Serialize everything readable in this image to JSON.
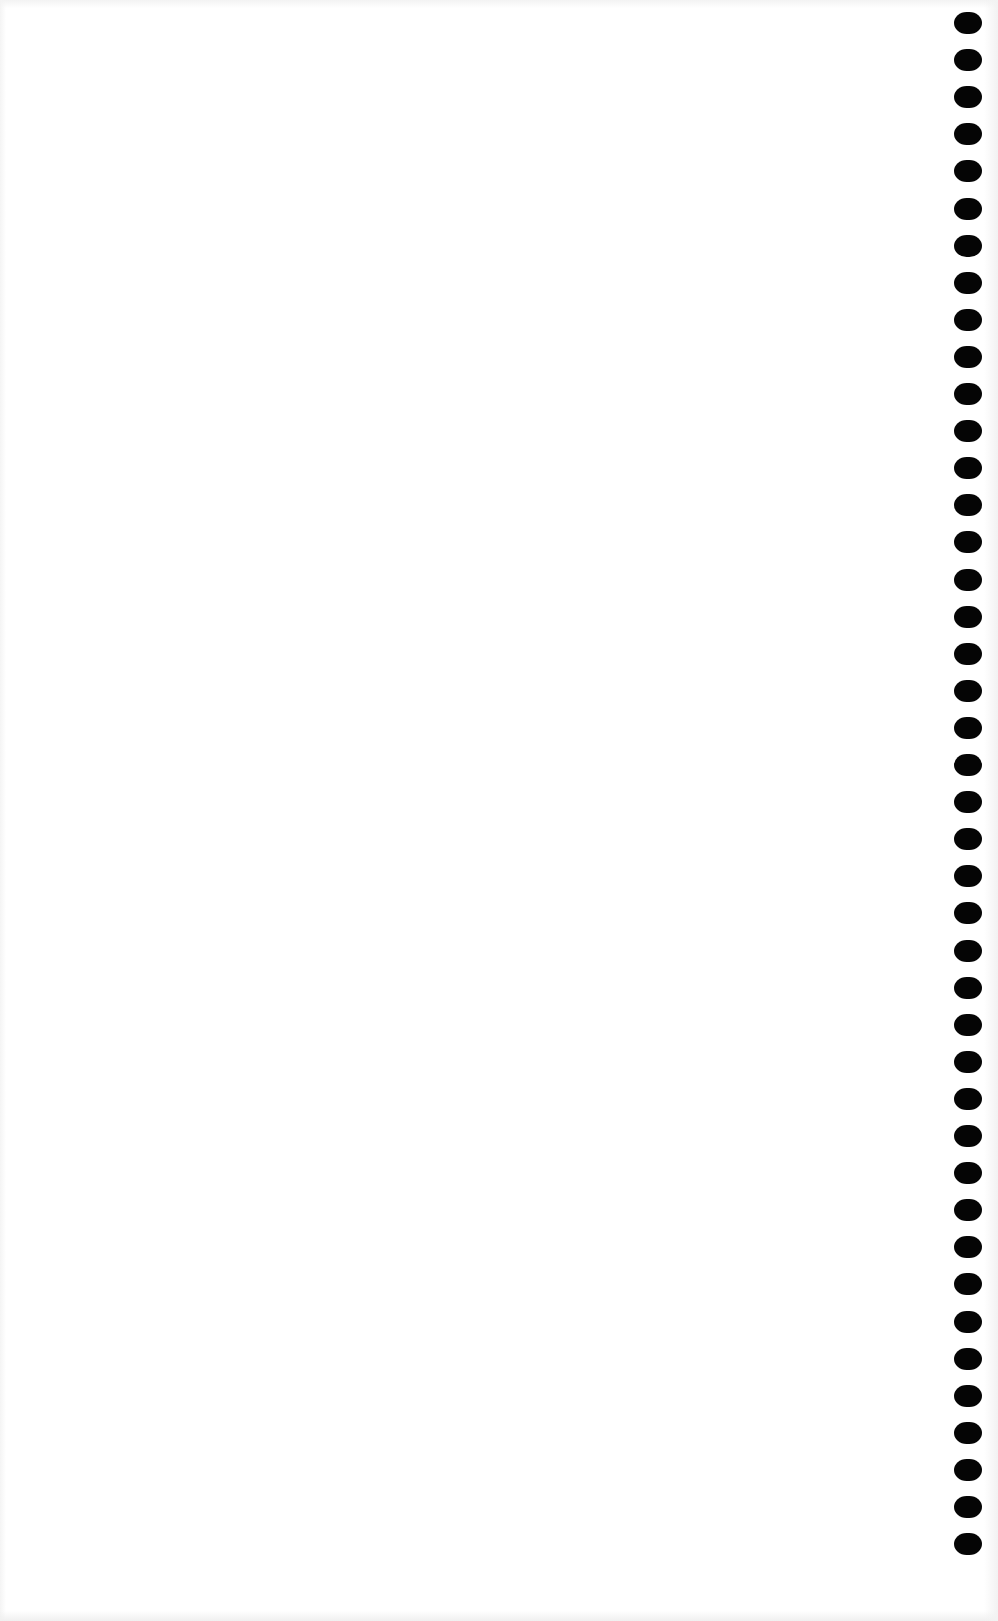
{
  "page": {
    "type": "blank-scanned-page",
    "background_color": "#ffffff",
    "text_content": ""
  },
  "binding": {
    "side": "right",
    "hole_color": "#050505",
    "hole_count": 42,
    "first_hole_top": 12,
    "hole_spacing": 37.1
  }
}
